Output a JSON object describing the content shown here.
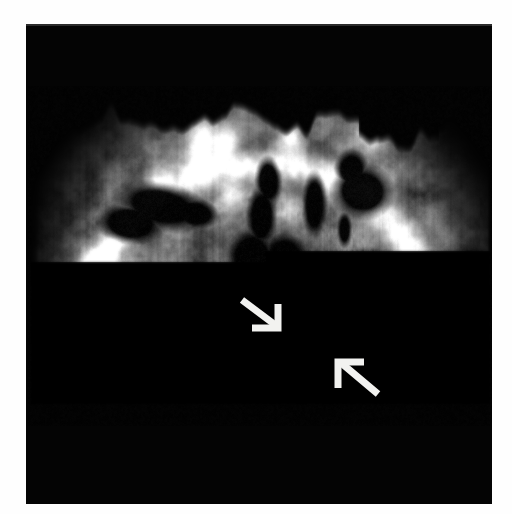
{
  "figure": {
    "domain": "medical-imaging",
    "modality_appearance": "grayscale cross-sectional scan (ultrasound / CT-like axial slice)",
    "orientation": "axial / transverse cross-section",
    "page_background": "#ffffff",
    "panel_background": "#040404",
    "caption": "",
    "label": "",
    "scan": {
      "colormap": "grayscale",
      "min_gray": "#000000",
      "max_gray": "#ffffff",
      "noise_character": "speckle with fine vertical streak artifacts",
      "has_jagged_top_edge": true,
      "has_bottom_notch": true
    },
    "annotations": [
      {
        "name": "arrow-1",
        "type": "arrow",
        "color": "#f2f2f0",
        "direction": "down-right",
        "tip_x": 252,
        "tip_y": 303,
        "tail_x": 216,
        "tail_y": 276,
        "points_at": "central bright midline structure"
      },
      {
        "name": "arrow-2",
        "type": "arrow",
        "color": "#f2f2f0",
        "direction": "up-left",
        "tip_x": 312,
        "tip_y": 338,
        "tail_x": 352,
        "tail_y": 370,
        "points_at": "right-of-midline bright band"
      }
    ],
    "regions": [
      {
        "name": "superior-bright-arc",
        "description": "bright hyperechoic arc across the top of the scan",
        "intensity": "high"
      },
      {
        "name": "left-dark-pocket",
        "description": "large dark (anechoic) blob left of center",
        "intensity": "very low"
      },
      {
        "name": "central-dark-cluster",
        "description": "cluster of elongated dark blobs in mid-field",
        "intensity": "very low"
      },
      {
        "name": "right-dark-pocket",
        "description": "dark blob right of center",
        "intensity": "very low"
      },
      {
        "name": "left-hotspots",
        "description": "two bright focal spots along the left margin",
        "intensity": "very high"
      },
      {
        "name": "right-hotspots",
        "description": "two bright focal spots along the right margin",
        "intensity": "very high"
      },
      {
        "name": "inferior-band",
        "description": "mid-gray horizontal band in lower third",
        "intensity": "medium"
      }
    ]
  }
}
